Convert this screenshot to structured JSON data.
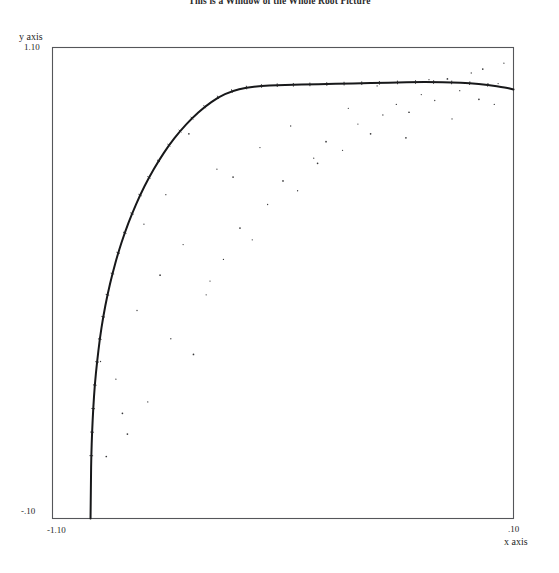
{
  "chart": {
    "title": "This is a Window of the Whole Root Picture",
    "y_axis_name": "y axis",
    "x_axis_name": "x axis",
    "y_max_label": "1.10",
    "y_min_label": "-.10",
    "x_min_label": "-1.10",
    "x_max_label": ".10"
  },
  "chart_data": {
    "type": "scatter",
    "title": "This is a Window of the Whole Root Picture",
    "xlabel": "x axis",
    "ylabel": "y axis",
    "xlim": [
      -1.1,
      0.1
    ],
    "ylim": [
      -0.1,
      1.1
    ],
    "xticks": [
      -1.1,
      0.1
    ],
    "xticklabels": [
      "-1.10",
      ".10"
    ],
    "yticks": [
      -0.1,
      1.1
    ],
    "yticklabels": [
      "-.10",
      "1.10"
    ],
    "grid": false,
    "legend": null,
    "series": [
      {
        "name": "root curve",
        "type": "line",
        "description": "Dense quarter-arc of roots; unit-circle arc rising from near (-1.00,-0.10) to a maximum near (-0.02,1.00) then easing toward the right frame edge.",
        "x": [
          -1.001,
          -1.0,
          -0.999,
          -0.997,
          -0.994,
          -0.99,
          -0.984,
          -0.977,
          -0.968,
          -0.957,
          -0.944,
          -0.929,
          -0.912,
          -0.893,
          -0.872,
          -0.849,
          -0.824,
          -0.797,
          -0.768,
          -0.737,
          -0.704,
          -0.669,
          -0.633,
          -0.595,
          -0.556,
          -0.515,
          -0.473,
          -0.43,
          -0.386,
          -0.341,
          -0.295,
          -0.249,
          -0.202,
          -0.155,
          -0.108,
          -0.061,
          -0.014,
          0.033,
          0.08,
          0.1
        ],
        "y": [
          -0.1,
          0.0,
          0.06,
          0.12,
          0.18,
          0.24,
          0.299,
          0.357,
          0.414,
          0.47,
          0.524,
          0.577,
          0.628,
          0.677,
          0.724,
          0.769,
          0.811,
          0.851,
          0.887,
          0.92,
          0.949,
          0.973,
          0.989,
          0.998,
          1.002,
          1.004,
          1.005,
          1.006,
          1.007,
          1.008,
          1.009,
          1.01,
          1.011,
          1.012,
          1.012,
          1.011,
          1.009,
          1.005,
          0.998,
          0.993
        ]
      },
      {
        "name": "scatter outliers",
        "type": "scatter",
        "description": "Sparse isolated sample points scattered on both sides of the root arc.",
        "x": [
          -0.905,
          -0.852,
          -0.792,
          -0.733,
          -0.7,
          -0.655,
          -0.612,
          -0.58,
          -0.54,
          -0.5,
          -0.462,
          -0.42,
          -0.388,
          -0.345,
          -0.305,
          -0.272,
          -0.24,
          -0.205,
          -0.172,
          -0.14,
          -0.105,
          -0.072,
          -0.04,
          -0.01,
          0.02,
          0.05,
          0.075,
          -0.96,
          -0.935,
          -0.88,
          -0.82,
          -0.76,
          -0.69,
          -0.63,
          -0.56,
          -0.48,
          -0.41,
          -0.33,
          -0.255,
          -0.18,
          -0.12,
          -0.06,
          0.01,
          0.06,
          -0.975,
          -0.918,
          -0.862,
          -0.805,
          -0.745,
          -0.672
        ],
        "y": [
          0.115,
          0.197,
          0.358,
          0.318,
          0.47,
          0.56,
          0.64,
          0.61,
          0.7,
          0.76,
          0.735,
          0.818,
          0.86,
          0.838,
          0.905,
          0.88,
          0.928,
          0.955,
          0.935,
          0.98,
          0.965,
          1.02,
          0.99,
          1.035,
          1.045,
          0.955,
          1.06,
          0.058,
          0.255,
          0.43,
          0.52,
          0.598,
          0.505,
          0.77,
          0.845,
          0.9,
          0.805,
          0.945,
          1.002,
          0.87,
          1.018,
          0.918,
          0.968,
          1.008,
          0.3,
          0.168,
          0.65,
          0.725,
          0.88,
          0.79
        ]
      }
    ]
  }
}
